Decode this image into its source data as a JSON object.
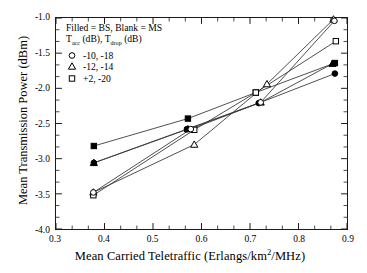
{
  "chart_data": {
    "type": "scatter",
    "title": "",
    "xlabel": "Mean Carried Teletraffic (Erlangs/km2/MHz)",
    "xlabel_parts": {
      "pre": "Mean Carried Teletraffic (Erlangs/km",
      "sup": "2",
      "post": "/MHz)"
    },
    "ylabel": "Mean Transmission Power (dBm)",
    "xlim": [
      0.3,
      0.9
    ],
    "ylim": [
      -4.0,
      -1.0
    ],
    "grid": false,
    "legend_position": "top-left-inside",
    "xticks": [
      0.3,
      0.4,
      0.5,
      0.6,
      0.7,
      0.8,
      0.9
    ],
    "xtick_labels": [
      "0.3",
      "0.4",
      "0.5",
      "0.6",
      "0.7",
      "0.8",
      "0.9"
    ],
    "yticks": [
      -1.0,
      -1.5,
      -2.0,
      -2.5,
      -3.0,
      -3.5,
      -4.0
    ],
    "ytick_labels": [
      "-1.0",
      "-1.5",
      "-2.0",
      "-2.5",
      "-3.0",
      "-3.5",
      "-4.0"
    ],
    "x_minor_per_interval": 2,
    "y_minor_per_interval": 2,
    "series": [
      {
        "name": "+2, -20 BS",
        "marker": "square",
        "fill": "filled",
        "legend_key": "+2, -20",
        "station": "BS",
        "x": [
          0.378,
          0.572,
          0.712,
          0.875
        ],
        "y": [
          -2.82,
          -2.43,
          -2.06,
          -1.64
        ]
      },
      {
        "name": "-10, -18 BS",
        "marker": "circle",
        "fill": "filled",
        "legend_key": "-10, -18",
        "station": "BS",
        "x": [
          0.378,
          0.57,
          0.718,
          0.875
        ],
        "y": [
          -3.06,
          -2.58,
          -2.21,
          -1.79
        ]
      },
      {
        "name": "-12, -14 BS",
        "marker": "triangle",
        "fill": "filled",
        "legend_key": "-12, -14",
        "station": "BS",
        "x": [
          0.378,
          0.572,
          0.722,
          0.87
        ],
        "y": [
          -3.06,
          -2.58,
          -2.2,
          -1.65
        ]
      },
      {
        "name": "-12, -14 MS",
        "marker": "triangle",
        "fill": "blank",
        "legend_key": "-12, -14",
        "station": "MS",
        "x": [
          0.377,
          0.585,
          0.735,
          0.872
        ],
        "y": [
          -3.48,
          -2.8,
          -1.94,
          -1.02
        ]
      },
      {
        "name": "+2, -20 MS",
        "marker": "square",
        "fill": "blank",
        "legend_key": "+2, -20",
        "station": "MS",
        "x": [
          0.377,
          0.585,
          0.712,
          0.877
        ],
        "y": [
          -3.52,
          -2.59,
          -2.06,
          -1.33
        ]
      },
      {
        "name": "-10, -18 MS",
        "marker": "circle",
        "fill": "blank",
        "legend_key": "-10, -18",
        "station": "MS",
        "x": [
          0.377,
          0.578,
          0.722,
          0.874
        ],
        "y": [
          -3.48,
          -2.58,
          -2.2,
          -1.04
        ]
      }
    ],
    "colors": {
      "line": "#3a3a3a",
      "marker": "#000000",
      "axis": "#1a1a1a",
      "background": "#ffffff"
    }
  },
  "legend": {
    "heading_line1": "Filled = BS, Blank = MS",
    "heading_line2_pre": "T",
    "heading_line2_sub1": "acc",
    "heading_line2_mid": " (dB), T",
    "heading_line2_sub2": "drop",
    "heading_line2_post": " (dB)",
    "entries": [
      {
        "marker": "circle",
        "label": "-10, -18"
      },
      {
        "marker": "triangle",
        "label": "-12, -14"
      },
      {
        "marker": "square",
        "label": "+2, -20"
      }
    ]
  }
}
